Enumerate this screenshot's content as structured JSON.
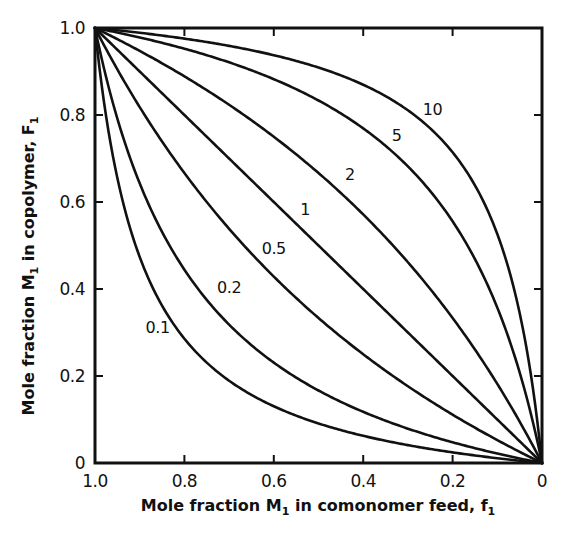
{
  "chart_data": {
    "type": "line",
    "title": "",
    "xlabel": "Mole fraction M1 in comonomer feed, f1",
    "ylabel": "Mole fraction M1 in copolymer, F1",
    "xlabel_parts": {
      "pre": "Mole fraction M",
      "sub1": "1",
      "mid": " in comonomer feed, f",
      "sub2": "1"
    },
    "ylabel_parts": {
      "pre": "Mole fraction M",
      "sub1": "1",
      "mid": " in copolymer, F",
      "sub2": "1"
    },
    "xlim": [
      1.0,
      0
    ],
    "ylim": [
      0,
      1.0
    ],
    "x_reversed": true,
    "grid": false,
    "legend": "inline labels on curves",
    "x_ticks": [
      "1.0",
      "0.8",
      "0.6",
      "0.4",
      "0.2",
      "0"
    ],
    "x_tick_values": [
      1.0,
      0.8,
      0.6,
      0.4,
      0.2,
      0
    ],
    "y_ticks": [
      "0",
      "0.2",
      "0.4",
      "0.6",
      "0.8",
      "1.0"
    ],
    "y_tick_values": [
      0,
      0.2,
      0.4,
      0.6,
      0.8,
      1.0
    ],
    "x": [
      0,
      0.1,
      0.2,
      0.3,
      0.4,
      0.5,
      0.6,
      0.7,
      0.8,
      0.9,
      1.0
    ],
    "series": [
      {
        "name": "0.1",
        "r1": 0.1,
        "label_pos": [
          0.86,
          0.3
        ],
        "values": [
          0,
          0.011,
          0.024,
          0.041,
          0.063,
          0.091,
          0.13,
          0.189,
          0.286,
          0.474,
          1
        ]
      },
      {
        "name": "0.2",
        "r1": 0.2,
        "label_pos": [
          0.7,
          0.39
        ],
        "values": [
          0,
          0.022,
          0.048,
          0.079,
          0.118,
          0.167,
          0.231,
          0.318,
          0.444,
          0.643,
          1
        ]
      },
      {
        "name": "0.5",
        "r1": 0.5,
        "label_pos": [
          0.6,
          0.48
        ],
        "values": [
          0,
          0.053,
          0.111,
          0.176,
          0.25,
          0.333,
          0.429,
          0.538,
          0.667,
          0.818,
          1
        ]
      },
      {
        "name": "1",
        "r1": 1,
        "label_pos": [
          0.53,
          0.57
        ],
        "values": [
          0,
          0.1,
          0.2,
          0.3,
          0.4,
          0.5,
          0.6,
          0.7,
          0.8,
          0.9,
          1
        ]
      },
      {
        "name": "2",
        "r1": 2,
        "label_pos": [
          0.43,
          0.65
        ],
        "values": [
          0,
          0.182,
          0.333,
          0.462,
          0.571,
          0.667,
          0.75,
          0.824,
          0.889,
          0.947,
          1
        ]
      },
      {
        "name": "5",
        "r1": 5,
        "label_pos": [
          0.325,
          0.74
        ],
        "values": [
          0,
          0.357,
          0.556,
          0.682,
          0.769,
          0.833,
          0.882,
          0.921,
          0.952,
          0.978,
          1
        ]
      },
      {
        "name": "10",
        "r1": 10,
        "label_pos": [
          0.245,
          0.8
        ],
        "values": [
          0,
          0.526,
          0.714,
          0.811,
          0.87,
          0.909,
          0.938,
          0.959,
          0.976,
          0.989,
          1
        ]
      }
    ],
    "annotations": [
      "Curves labeled with reactivity ratio r1 (ideal copolymerization, r1*r2 = 1)"
    ]
  },
  "colors": {
    "ink": "#111111",
    "background": "#ffffff"
  }
}
